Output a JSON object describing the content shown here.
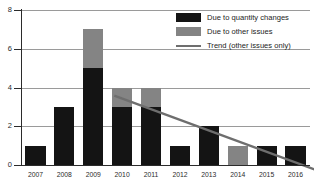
{
  "chart_data": {
    "type": "bar",
    "stacked": true,
    "title": "",
    "xlabel": "",
    "ylabel": "",
    "categories": [
      "2007",
      "2008",
      "2009",
      "2010",
      "2011",
      "2012",
      "2013",
      "2014",
      "2015",
      "2016"
    ],
    "series": [
      {
        "name": "Due to quantity changes",
        "color": "#141414",
        "values": [
          1,
          3,
          5,
          3,
          3,
          1,
          2,
          0,
          1,
          1
        ]
      },
      {
        "name": "Due to other issues",
        "color": "#848484",
        "values": [
          0,
          0,
          2,
          1,
          1,
          0,
          0,
          1,
          0,
          0
        ]
      }
    ],
    "totals": [
      1,
      3,
      7,
      4,
      4,
      1,
      2,
      1,
      1,
      1
    ],
    "trend": {
      "name": "Trend (other issues only)",
      "color": "#6e6e6e",
      "points": [
        {
          "x": 2009,
          "y": 4.1
        },
        {
          "x": 2016.45,
          "y": 0.0
        }
      ]
    },
    "ylim": [
      0,
      8
    ],
    "yticks": [
      0,
      2,
      4,
      6,
      8
    ],
    "ytick_labels": [
      "0",
      "2",
      "4",
      "6",
      "8"
    ],
    "grid": true,
    "grid_axis": "y",
    "legend_position": "top-right",
    "legend": [
      {
        "label": "Due to quantity changes",
        "marker": "swatch",
        "color": "#141414"
      },
      {
        "label": "Due to other issues",
        "marker": "swatch",
        "color": "#848484"
      },
      {
        "label": "Trend (other issues only)",
        "marker": "line",
        "color": "#6e6e6e"
      }
    ]
  }
}
